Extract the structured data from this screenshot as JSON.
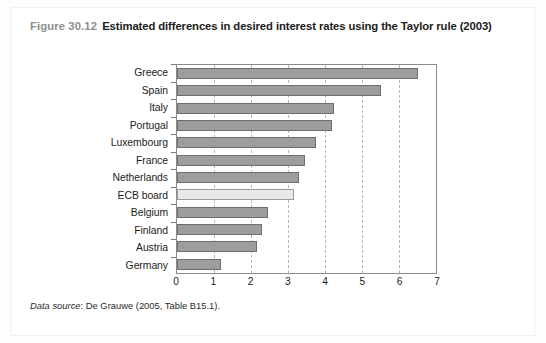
{
  "figure": {
    "number": "Figure 30.12",
    "title": "Estimated differences in desired interest rates using the Taylor rule (2003)",
    "source_label": "Data source",
    "source_text": ": De Grauwe (2005, Table B15.1)."
  },
  "colors": {
    "bar_fill": "#9d9d9d",
    "bar_stroke": "#6e6e6e",
    "highlight_fill": "#e9e9e9",
    "highlight_stroke": "#9a9a9a",
    "gridline": "#b6b6b6",
    "axis": "#8b8b8b",
    "caption_number": "#8e8e8e",
    "caption_title": "#1c1c1c"
  },
  "chart_data": {
    "type": "bar",
    "orientation": "horizontal",
    "title": "Estimated differences in desired interest rates using the Taylor rule (2003)",
    "xlabel": "",
    "ylabel": "",
    "xlim": [
      0,
      7
    ],
    "xticks": [
      0,
      1,
      2,
      3,
      4,
      5,
      6,
      7
    ],
    "xtick_labels": [
      "0",
      "1",
      "2",
      "3",
      "4",
      "5",
      "6",
      "7"
    ],
    "grid": true,
    "grid_axis": "x",
    "legend": false,
    "categories": [
      "Greece",
      "Spain",
      "Italy",
      "Portugal",
      "Luxembourg",
      "France",
      "Netherlands",
      "ECB board",
      "Belgium",
      "Finland",
      "Austria",
      "Germany"
    ],
    "values": [
      6.5,
      5.5,
      4.25,
      4.2,
      3.75,
      3.45,
      3.3,
      3.15,
      2.45,
      2.3,
      2.15,
      1.2
    ],
    "highlight_category": "ECB board"
  }
}
